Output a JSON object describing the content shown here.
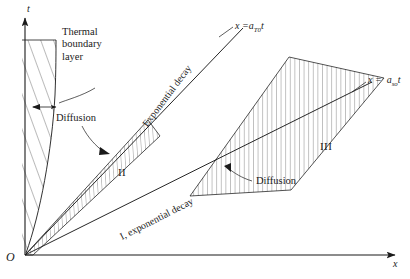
{
  "figure": {
    "name": "wave-diffusion-regimes-diagram",
    "background_color": "#ffffff",
    "line_color": "#1a1a1a",
    "hatch_color": "#555555"
  },
  "axes": {
    "t_axis_label": "t",
    "x_axis_label": "x",
    "origin_label": "O"
  },
  "annotations": {
    "thermal_boundary_layer": "Thermal\nboundary\nlayer",
    "thermal_boundary_layer_line1": "Thermal",
    "thermal_boundary_layer_line2": "boundary",
    "thermal_boundary_layer_line3": "layer",
    "diffusion_left": "Diffusion",
    "diffusion_right": "Diffusion",
    "exponential_decay_upper": "Exponential decay",
    "exponential_decay_lower": "I, exponential decay",
    "region_two": "II",
    "region_three": "III"
  },
  "equations": {
    "upper_line": {
      "lhs": "x =",
      "coef": "a",
      "subscript": "T0",
      "var": "t"
    },
    "lower_line": {
      "lhs": "x =",
      "coef": "a",
      "subscript": "so",
      "var": "t"
    }
  }
}
